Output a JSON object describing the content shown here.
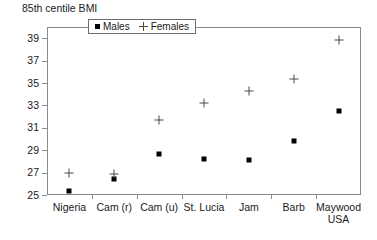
{
  "chart_data": {
    "type": "scatter",
    "title": "85th centile BMI",
    "xlabel": "",
    "ylabel": "",
    "ylim": [
      25,
      40
    ],
    "yticks": [
      25,
      27,
      29,
      31,
      33,
      35,
      37,
      39
    ],
    "ytick_labels": [
      "25",
      "27",
      "29",
      "31",
      "33",
      "35",
      "37",
      "39"
    ],
    "grid": false,
    "legend_position": "top-center-inside",
    "categories": [
      "Nigeria",
      "Cam (r)",
      "Cam (u)",
      "St. Lucia",
      "Jam",
      "Barb",
      "Maywood USA"
    ],
    "category_lines": [
      [
        "Nigeria"
      ],
      [
        "Cam (r)"
      ],
      [
        "Cam (u)"
      ],
      [
        "St. Lucia"
      ],
      [
        "Jam"
      ],
      [
        "Barb"
      ],
      [
        "Maywood",
        "USA"
      ]
    ],
    "series": [
      {
        "name": "Males",
        "marker": "filled-square",
        "color": "#000000",
        "values": [
          25.4,
          26.4,
          28.7,
          28.2,
          28.1,
          29.8,
          32.5
        ]
      },
      {
        "name": "Females",
        "marker": "plus",
        "color": "#4a4a4a",
        "values": [
          27.0,
          26.9,
          31.7,
          33.2,
          34.3,
          35.4,
          38.8
        ]
      }
    ]
  },
  "legend": {
    "entries": [
      {
        "label": "Males",
        "marker": "filled-square"
      },
      {
        "label": "Females",
        "marker": "plus"
      }
    ]
  },
  "colors": {
    "axis": "#8a8a8a",
    "text": "#1a1a1a",
    "male_marker": "#000000",
    "female_marker": "#4a4a4a",
    "background": "#ffffff"
  }
}
